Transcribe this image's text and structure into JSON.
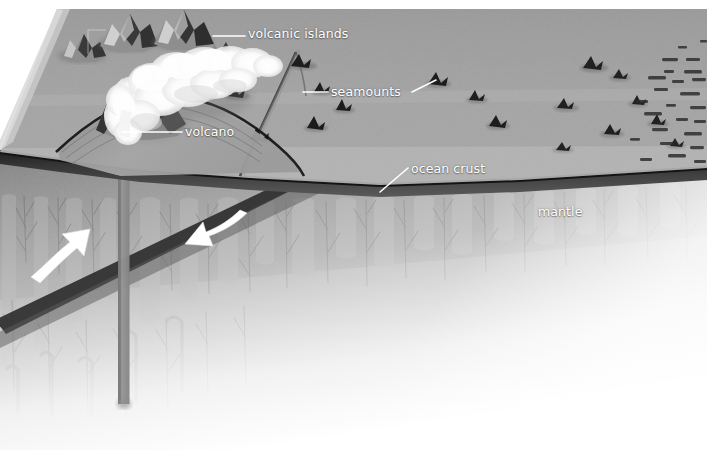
{
  "figure": {
    "type": "geology-block-diagram",
    "width": 707,
    "height": 450,
    "background_color": "#ffffff"
  },
  "labels": {
    "volcanic_islands": "volcanic islands",
    "seamounts": "seamounts",
    "volcano": "volcano",
    "ocean_crust": "ocean crust",
    "mantle": "mantle"
  },
  "colors": {
    "label_text": "#ffffff",
    "leader_line": "#ffffff",
    "flow_arrow": "#ffffff",
    "sea_surface": "#a9a9a9",
    "sea_surface_light_band": "#b4b4b4",
    "block_left_face": "#9a9a9a",
    "ocean_crust_dark": "#2b2b2b",
    "ocean_crust_band": "#4e4e4e",
    "mantle": "#8d8d8d",
    "mantle_deep": "#9b9b9b",
    "mantle_shear_band": "#3a3a3a",
    "plume_conduit": "#8e8e8e",
    "seamount_dark": "#1c1c1c",
    "plume_cloud": "#fdfdfd",
    "fade_to": "#ffffff"
  },
  "elements": {
    "sea_surface_note": "grey parallelogram top face of the block, upper-left vertex near (57,9)",
    "flow_arrows": [
      {
        "name": "mantle-flow-arrow-left",
        "direction": "up-right",
        "x": 33,
        "y": 272
      },
      {
        "name": "mantle-flow-arrow-right",
        "direction": "down-left",
        "x": 245,
        "y": 217
      }
    ],
    "seamount_count": 34,
    "volcanic_island_count": 4,
    "plume_conduit": {
      "x": 118,
      "top": 112,
      "bottom": 404,
      "width": 11
    },
    "leader_lines": [
      {
        "name": "volcanic-islands-leader",
        "x1": 213,
        "y1": 36,
        "x2": 245,
        "y2": 36
      },
      {
        "name": "seamounts-leader-left",
        "x1": 303,
        "y1": 92,
        "x2": 328,
        "y2": 92
      },
      {
        "name": "seamounts-leader-right",
        "x1": 411,
        "y1": 92,
        "x2": 434,
        "y2": 80
      },
      {
        "name": "volcano-leader",
        "x1": 122,
        "y1": 132,
        "x2": 182,
        "y2": 132
      },
      {
        "name": "ocean-crust-leader",
        "x1": 408,
        "y1": 168,
        "x2": 381,
        "y2": 191
      }
    ]
  }
}
